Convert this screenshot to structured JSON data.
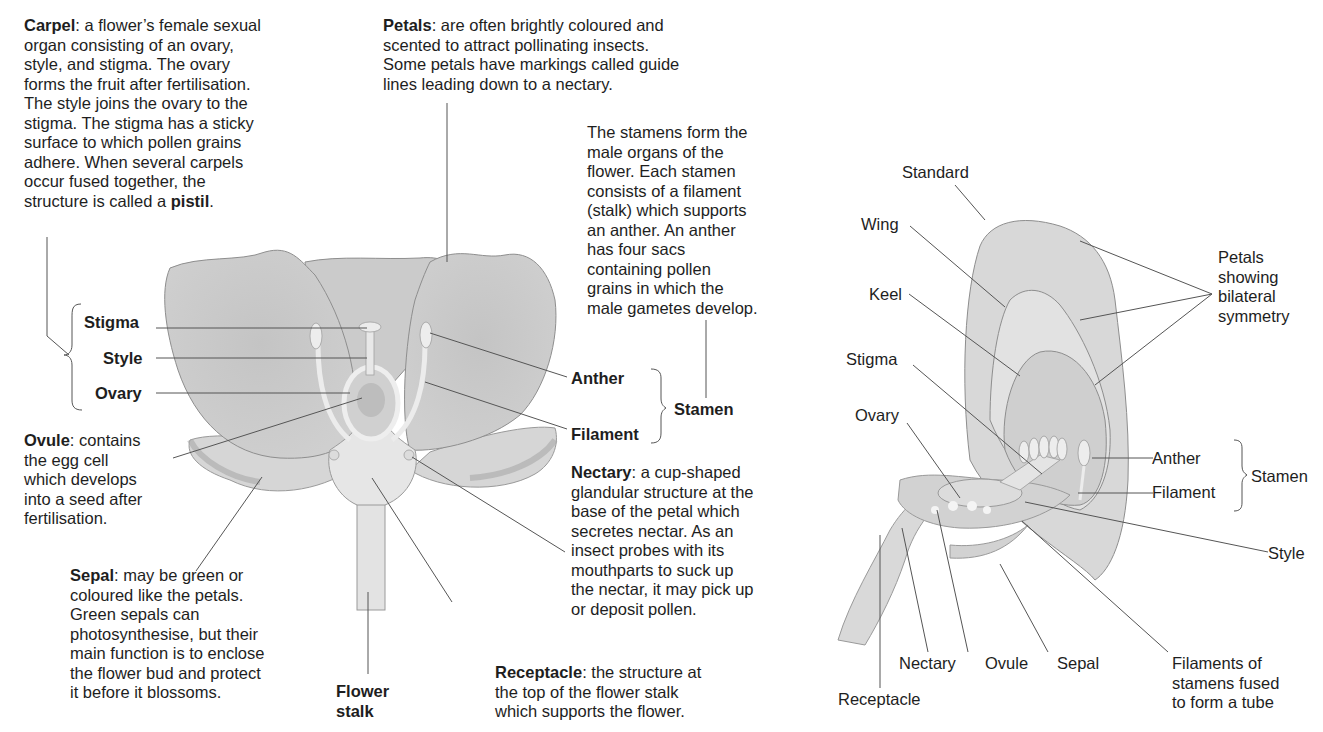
{
  "left_diagram": {
    "descriptions": {
      "carpel": {
        "term": "Carpel",
        "text": ": a flower’s female sexual\norgan consisting of an ovary,\nstyle, and stigma. The ovary\nforms the fruit after fertilisation.\nThe style joins the ovary to the\nstigma. The stigma has a sticky\nsurface to which pollen grains\nadhere. When several carpels\noccur fused together, the\nstructure is called a ",
        "term2": "pistil",
        "tail": "."
      },
      "petals": {
        "term": "Petals",
        "text": ": are often brightly coloured and\nscented to attract pollinating insects.\nSome petals have markings called guide\nlines leading down to a nectary."
      },
      "stamens": {
        "text": "The stamens form the\nmale organs of the\nflower. Each stamen\nconsists of a filament\n(stalk) which supports\nan anther. An anther\nhas four sacs\ncontaining pollen\ngrains in which the\nmale gametes develop."
      },
      "ovule": {
        "term": "Ovule",
        "text": ": contains\nthe egg cell\nwhich develops\ninto a seed after\nfertilisation."
      },
      "nectary": {
        "term": "Nectary",
        "text": ": a cup-shaped\nglandular structure at the\nbase of the petal which\nsecretes nectar. As an\ninsect probes with its\nmouthparts to suck up\nthe nectar, it may pick up\nor deposit pollen."
      },
      "sepal": {
        "term": "Sepal",
        "text": ": may be green or\ncoloured like the petals.\nGreen sepals can\nphotosynthesise, but their\nmain function is to enclose\nthe flower bud and protect\nit before it blossoms."
      },
      "receptacle": {
        "term": "Receptacle",
        "text": ": the structure at\nthe top of the flower stalk\nwhich supports the flower."
      }
    },
    "labels": {
      "stigma": "Stigma",
      "style": "Style",
      "ovary": "Ovary",
      "anther": "Anther",
      "filament": "Filament",
      "stamen": "Stamen",
      "flower_stalk": "Flower\nstalk"
    }
  },
  "right_diagram": {
    "labels": {
      "standard": "Standard",
      "wing": "Wing",
      "keel": "Keel",
      "stigma": "Stigma",
      "ovary": "Ovary",
      "petals_note": "Petals\nshowing\nbilateral\nsymmetry",
      "anther": "Anther",
      "filament": "Filament",
      "stamen": "Stamen",
      "style": "Style",
      "nectary": "Nectary",
      "ovule": "Ovule",
      "sepal": "Sepal",
      "receptacle": "Receptacle",
      "filaments_tube": "Filaments of\nstamens fused\nto form a tube"
    }
  },
  "colors": {
    "petal_fill": "#c9c9c9",
    "petal_stroke": "#8e8e8e",
    "light_fill": "#e6e6e6",
    "line": "#555555",
    "text": "#1e1e1e"
  }
}
